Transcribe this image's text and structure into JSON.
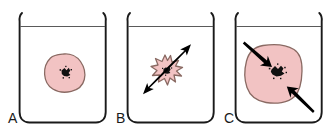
{
  "figure": {
    "background_color": "#ffffff",
    "width": 329,
    "height": 135
  },
  "colors": {
    "cell_fill": "#f2c3c3",
    "cell_stroke": "#8a6a63",
    "nucleus": "#111111",
    "beaker_stroke": "#1a1a1a",
    "liquid_line": "#5a5a5a",
    "arrow": "#000000",
    "label_text": "#1a1a1a"
  },
  "panels": [
    {
      "id": "panel-a",
      "label": "A",
      "beaker": {
        "liquid_level_visible": true
      },
      "cell": {
        "shape": "rounded-irregular-blob",
        "size": "normal",
        "state": "isotonic-normal",
        "nucleus_visible": true
      },
      "arrows": []
    },
    {
      "id": "panel-b",
      "label": "B",
      "beaker": {
        "liquid_level_visible": true
      },
      "cell": {
        "shape": "crenated-star",
        "size": "shrunken",
        "state": "hypertonic-crenated",
        "nucleus_visible": true
      },
      "arrows": [
        {
          "direction": "outward-upper-right"
        },
        {
          "direction": "outward-lower-left"
        }
      ]
    },
    {
      "id": "panel-c",
      "label": "C",
      "beaker": {
        "liquid_level_visible": true
      },
      "cell": {
        "shape": "rounded-square-swollen",
        "size": "enlarged",
        "state": "hypotonic-swollen",
        "nucleus_visible": true
      },
      "arrows": [
        {
          "direction": "inward-upper-left"
        },
        {
          "direction": "inward-lower-right"
        }
      ]
    }
  ]
}
